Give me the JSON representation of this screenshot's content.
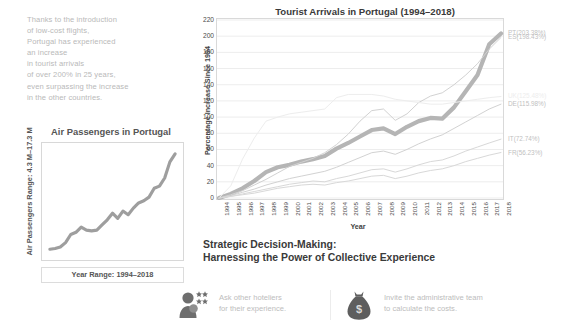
{
  "narrative": {
    "lines": [
      "Thanks to the introduction",
      "of low-cost flights,",
      "Portugal has experienced",
      "an increase",
      "in tourist arrivals",
      "of over 200% in 25 years,",
      "even surpassing the increase",
      "in the other countries."
    ]
  },
  "mini_chart": {
    "title": "Air Passengers in Portugal",
    "ylabel": "Air Passengers Range: 4.3 M–17.3 M",
    "xlabel": "Year Range: 1994–2018"
  },
  "main_chart": {
    "title": "Tourist Arrivals in Portugal (1994–2018)",
    "series_labels": [
      {
        "text": "PT(203.38%)",
        "color": "#bfbfbf"
      },
      {
        "text": "ES(198.43%)",
        "color": "#bfbfbf"
      },
      {
        "text": "UK(125.48%)",
        "color": "#ededed"
      },
      {
        "text": "DE(115.98%)",
        "color": "#bfbfbf"
      },
      {
        "text": "IT(72.74%)",
        "color": "#bfbfbf"
      },
      {
        "text": "FR(56.23%)",
        "color": "#bfbfbf"
      }
    ]
  },
  "heading": {
    "line1": "Strategic Decision-Making:",
    "line2": "Harnessing the Power of Collective Experience"
  },
  "callouts": [
    {
      "icon": "people-stars-icon",
      "line1": "Ask other hoteliers",
      "line2": "for their experience."
    },
    {
      "icon": "money-bag-icon",
      "line1": "Invite the administrative team",
      "line2": "to calculate the costs."
    }
  ],
  "chart_data": {
    "type": "line",
    "title": "Tourist Arrivals in Portugal (1994–2018)",
    "xlabel": "Year",
    "ylabel": "Percentage Increase Since 1994",
    "ylim": [
      0,
      220
    ],
    "yticks": [
      0,
      20,
      40,
      60,
      80,
      100,
      120,
      140,
      160,
      180,
      200,
      220
    ],
    "grid": true,
    "legend": "right-of-plot (end-of-line labels)",
    "x": [
      1994,
      1995,
      1996,
      1997,
      1998,
      1999,
      2000,
      2001,
      2002,
      2003,
      2004,
      2005,
      2006,
      2007,
      2008,
      2009,
      2010,
      2011,
      2012,
      2013,
      2014,
      2015,
      2016,
      2017,
      2018
    ],
    "xticklabels": [
      "1994",
      "1995",
      "1996",
      "1997",
      "1998",
      "1999",
      "2000",
      "2001",
      "2002",
      "2003",
      "2004",
      "2005",
      "2006",
      "2007",
      "2008",
      "2009",
      "2010",
      "2011",
      "2012",
      "2013",
      "2014",
      "2015",
      "2016",
      "2017",
      "2018"
    ],
    "series": [
      {
        "name": "PT",
        "label": "PT(203.38%)",
        "final_value": 203.38,
        "highlight": true,
        "color": "#b5b5b5",
        "values": [
          0,
          5,
          12,
          21,
          32,
          38,
          41,
          45,
          48,
          52,
          61,
          68,
          76,
          84,
          86,
          79,
          88,
          95,
          99,
          98,
          112,
          132,
          152,
          190,
          203.38
        ]
      },
      {
        "name": "ES",
        "label": "ES(198.43%)",
        "final_value": 198.43,
        "highlight": false,
        "color": "#d2d2d2",
        "values": [
          0,
          4,
          9,
          16,
          23,
          31,
          39,
          44,
          49,
          56,
          66,
          79,
          95,
          108,
          110,
          96,
          104,
          118,
          126,
          130,
          140,
          152,
          166,
          184,
          198.43
        ]
      },
      {
        "name": "UK",
        "label": "UK(125.48%)",
        "final_value": 125.48,
        "highlight": false,
        "color": "#ededed",
        "values": [
          0,
          15,
          48,
          74,
          95,
          100,
          104,
          106,
          108,
          110,
          124,
          128,
          128,
          128,
          126,
          122,
          120,
          118,
          116,
          116,
          118,
          120,
          122,
          124,
          125.48
        ]
      },
      {
        "name": "DE",
        "label": "DE(115.98%)",
        "final_value": 115.98,
        "highlight": false,
        "color": "#d2d2d2",
        "values": [
          0,
          3,
          7,
          11,
          16,
          20,
          24,
          27,
          30,
          33,
          38,
          44,
          50,
          56,
          58,
          54,
          60,
          67,
          73,
          78,
          86,
          94,
          102,
          110,
          115.98
        ]
      },
      {
        "name": "IT",
        "label": "IT(72.74%)",
        "final_value": 72.74,
        "highlight": false,
        "color": "#d8d8d8",
        "values": [
          0,
          2,
          5,
          8,
          11,
          14,
          17,
          19,
          21,
          20,
          24,
          27,
          31,
          35,
          36,
          32,
          36,
          41,
          45,
          47,
          52,
          58,
          63,
          68,
          72.74
        ]
      },
      {
        "name": "FR",
        "label": "FR(56.23%)",
        "final_value": 56.23,
        "highlight": false,
        "color": "#d8d8d8",
        "values": [
          0,
          2,
          4,
          6,
          9,
          12,
          14,
          16,
          17,
          16,
          19,
          21,
          24,
          27,
          28,
          24,
          27,
          31,
          34,
          36,
          40,
          45,
          49,
          53,
          56.23
        ]
      }
    ]
  },
  "mini_chart_data": {
    "type": "line",
    "title": "Air Passengers in Portugal",
    "xlabel": "Year Range: 1994–2018",
    "ylabel": "Air Passengers Range: 4.3 M–17.3 M",
    "ylim": [
      4.3,
      17.3
    ],
    "x": [
      1994,
      1995,
      1996,
      1997,
      1998,
      1999,
      2000,
      2001,
      2002,
      2003,
      2004,
      2005,
      2006,
      2007,
      2008,
      2009,
      2010,
      2011,
      2012,
      2013,
      2014,
      2015,
      2016,
      2017,
      2018
    ],
    "values": [
      4.3,
      4.4,
      4.6,
      5.2,
      6.3,
      6.6,
      7.3,
      6.9,
      6.8,
      6.9,
      7.6,
      8.3,
      9.2,
      8.5,
      9.5,
      9.0,
      9.9,
      10.6,
      10.9,
      11.4,
      12.6,
      12.9,
      14.0,
      16.2,
      17.3
    ]
  }
}
